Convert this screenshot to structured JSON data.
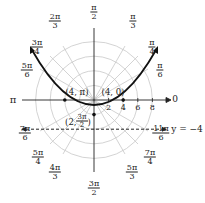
{
  "figure": {
    "type": "polar-graph",
    "center": {
      "x": 94,
      "y": 100
    },
    "unit_px": 7.3,
    "ring_radii": [
      2,
      4,
      6,
      8
    ],
    "radial_tick_labels": [
      "2",
      "4",
      "6",
      "8"
    ],
    "angle_labels": [
      {
        "num": "π",
        "den": "2",
        "x": 94,
        "y": 12
      },
      {
        "num": "π",
        "den": "3",
        "x": 133,
        "y": 21
      },
      {
        "num": "π",
        "den": "4",
        "x": 152,
        "y": 47
      },
      {
        "num": "π",
        "den": "6",
        "x": 160,
        "y": 70
      },
      {
        "num": "2π",
        "den": "3",
        "x": 55,
        "y": 21
      },
      {
        "num": "3π",
        "den": "4",
        "x": 37,
        "y": 47
      },
      {
        "num": "5π",
        "den": "6",
        "x": 27,
        "y": 70
      },
      {
        "num": "7π",
        "den": "6",
        "x": 25,
        "y": 133
      },
      {
        "num": "5π",
        "den": "4",
        "x": 38,
        "y": 157
      },
      {
        "num": "4π",
        "den": "3",
        "x": 55,
        "y": 172
      },
      {
        "num": "3π",
        "den": "2",
        "x": 94,
        "y": 188
      },
      {
        "num": "5π",
        "den": "3",
        "x": 132,
        "y": 172
      },
      {
        "num": "7π",
        "den": "4",
        "x": 150,
        "y": 157
      },
      {
        "num": "11π",
        "den": "6",
        "x": 161,
        "y": 133
      }
    ],
    "axis_labels": {
      "pi": "π",
      "zero": "0"
    },
    "points": [
      {
        "label": "(4, π)",
        "r": 4,
        "theta": "π"
      },
      {
        "label": "(4, 0)",
        "r": 4,
        "theta": "0"
      },
      {
        "label_prefix": "(2, ",
        "num": "3π",
        "den": "2",
        "label_suffix": ")",
        "r": 2,
        "theta": "3π/2"
      }
    ],
    "directrix_label": "y = −4",
    "curve": "parabola r = 4/(1 − sin θ)",
    "colors": {
      "grid": "#c8c8c8",
      "curve": "#111111",
      "axis": "#222222"
    }
  }
}
